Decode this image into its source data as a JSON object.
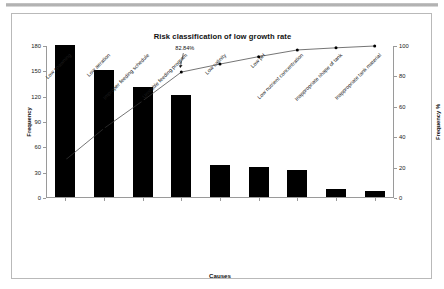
{
  "figure": {
    "title": "Risk classification of low growth rate",
    "xlabel": "Causes",
    "ylabel_left": "Frequency",
    "ylabel_right": "Frequency %",
    "annotation": "82.84%"
  },
  "chart_data": {
    "type": "bar",
    "title": "Risk classification of low growth rate",
    "xlabel": "Causes",
    "ylabel": "Frequency",
    "ylabel_secondary": "Frequency %",
    "grid": false,
    "legend": "none",
    "ylim": [
      0,
      180
    ],
    "ylim_secondary": [
      0,
      100
    ],
    "yticks": [
      0,
      30,
      60,
      90,
      120,
      150,
      180
    ],
    "yticks_secondary": [
      0,
      20,
      40,
      60,
      80,
      100
    ],
    "categories": [
      "Low spawning",
      "Low aeration",
      "Improper feeding schedule",
      "Unstable feeding program",
      "Low salinity",
      "Low pH",
      "Low nutrient concentration",
      "Inappropriate shape of tank",
      "Inappropriate tank material"
    ],
    "series": [
      {
        "name": "Frequency",
        "type": "bar",
        "values": [
          180,
          150,
          130,
          121,
          38,
          35,
          32,
          10,
          7
        ]
      },
      {
        "name": "Cumulative %",
        "type": "line",
        "axis": "secondary",
        "values": [
          25.0,
          45.8,
          63.9,
          82.84,
          88.1,
          93.0,
          97.4,
          98.8,
          100.0
        ]
      }
    ],
    "annotations": [
      {
        "text": "82.84%",
        "series": "Cumulative %",
        "category_index": 3,
        "value": 82.84
      }
    ]
  },
  "ytick_labels_left": [
    "180",
    "150",
    "120",
    "90",
    "60",
    "30",
    "0"
  ],
  "ytick_labels_right": [
    "100",
    "80",
    "60",
    "40",
    "20",
    "0"
  ]
}
